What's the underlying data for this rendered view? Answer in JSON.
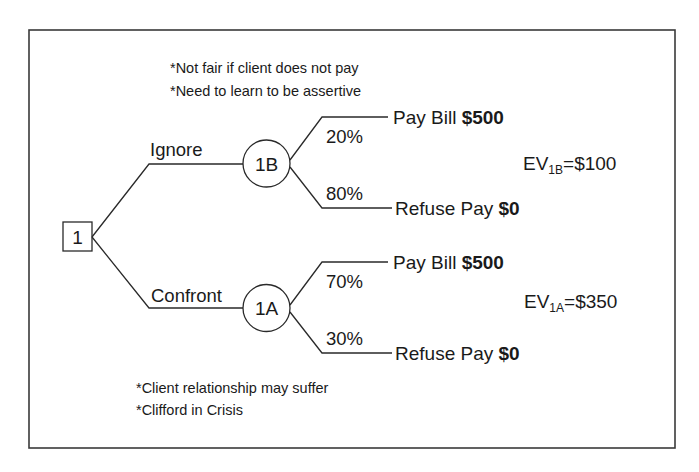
{
  "diagram": {
    "type": "decision-tree",
    "root": {
      "id": "1",
      "shape": "square"
    },
    "top_notes": [
      "*Not fair if client does not pay",
      "*Need to learn to be assertive"
    ],
    "bottom_notes": [
      "*Client relationship may suffer",
      "*Clifford in Crisis"
    ],
    "branches": [
      {
        "label": "Ignore",
        "node": "1B",
        "outcomes": [
          {
            "prob": "20%",
            "label": "Pay Bill",
            "value": "$500"
          },
          {
            "prob": "80%",
            "label": "Refuse Pay",
            "value": "$0"
          }
        ],
        "ev": {
          "prefix": "EV",
          "sub": "1B",
          "suffix": "=$100"
        }
      },
      {
        "label": "Confront",
        "node": "1A",
        "outcomes": [
          {
            "prob": "70%",
            "label": "Pay Bill",
            "value": "$500"
          },
          {
            "prob": "30%",
            "label": "Refuse Pay",
            "value": "$0"
          }
        ],
        "ev": {
          "prefix": "EV",
          "sub": "1A",
          "suffix": "=$350"
        }
      }
    ]
  }
}
